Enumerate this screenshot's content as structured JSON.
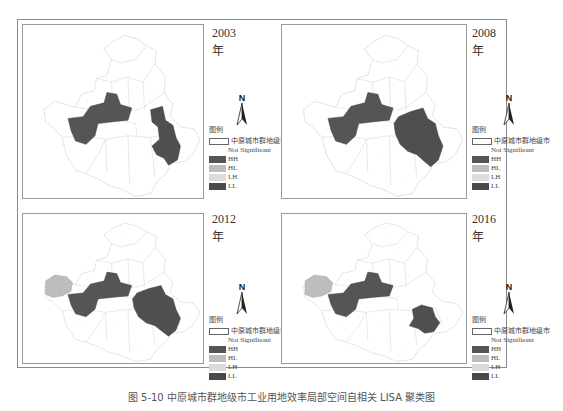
{
  "figure": {
    "caption": "图 5-10  中原城市群地级市工业用地效率局部空间自相关 LISA 聚类图"
  },
  "legend": {
    "title": "图例",
    "boundary_label": "中原城市群地级市",
    "items": [
      {
        "key": "NS",
        "label": "Not Signifieant",
        "color": "#ffffff"
      },
      {
        "key": "HH",
        "label": "HH",
        "color": "#555555"
      },
      {
        "key": "HL",
        "label": "HL",
        "color": "#bdbdbd"
      },
      {
        "key": "LH",
        "label": "LH",
        "color": "#dcdcdc"
      },
      {
        "key": "LL",
        "label": "LL",
        "color": "#4a4a4a"
      }
    ]
  },
  "north_arrow": {
    "label": "N"
  },
  "panels": [
    {
      "year": "2003年",
      "clusters": {
        "HH": [
          "west-central cluster",
          "east cluster"
        ],
        "HL": [],
        "LH": [],
        "LL": []
      }
    },
    {
      "year": "2008年",
      "clusters": {
        "HH": [
          "west-central cluster",
          "east cluster"
        ],
        "HL": [],
        "LH": [],
        "LL": []
      }
    },
    {
      "year": "2012年",
      "clusters": {
        "HH": [
          "west-central cluster",
          "east cluster"
        ],
        "HL": [
          "far-west city"
        ],
        "LH": [],
        "LL": []
      }
    },
    {
      "year": "2016年",
      "clusters": {
        "HH": [
          "west-central cluster",
          "south-east city"
        ],
        "HL": [
          "far-west city"
        ],
        "LH": [],
        "LL": []
      }
    }
  ],
  "colors": {
    "frame": "#8a8a8a",
    "region_fill": "#ffffff",
    "region_stroke": "#c8c8c8",
    "hh": "#555555",
    "hl": "#bdbdbd"
  }
}
